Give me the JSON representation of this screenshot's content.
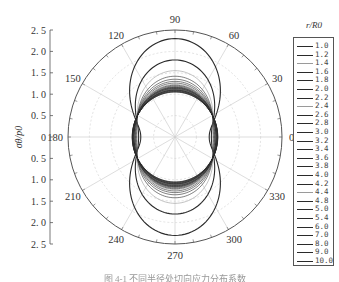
{
  "chart_data": {
    "type": "polar-line",
    "title": "",
    "caption": "图 4-1 不同半径处切向应力分布系数",
    "ylabel": "σθ/p0",
    "radial_axis": {
      "range": [
        0,
        2.5
      ],
      "ticks_upper": [
        "2.5",
        "2.0",
        "1.5",
        "1.0",
        "0.5",
        "0"
      ],
      "ticks_lower": [
        "0.5",
        "1.0",
        "1.5",
        "2.0",
        "2.5"
      ]
    },
    "angular_axis": {
      "unit": "degrees",
      "ticks": [
        0,
        30,
        60,
        90,
        120,
        150,
        180,
        210,
        240,
        270,
        300,
        330
      ],
      "labels": [
        "0",
        "30",
        "60",
        "90",
        "120",
        "150",
        "180",
        "210",
        "240",
        "270",
        "300",
        "330"
      ]
    },
    "legend": {
      "title": "r/R0",
      "position": "right",
      "entries": [
        "1.0",
        "1.2",
        "1.4",
        "1.6",
        "1.8",
        "2.0",
        "2.2",
        "2.4",
        "2.6",
        "2.8",
        "3.0",
        "3.2",
        "3.4",
        "3.6",
        "3.8",
        "4.0",
        "4.2",
        "4.4",
        "4.8",
        "5.0",
        "5.4",
        "6.0",
        "7.0",
        "8.0",
        "9.0",
        "10.0"
      ]
    },
    "series_summary": {
      "description": "Approximate sigma_theta/p0 at 0/180 deg (sides) and 90/270 deg (top/bottom) per r/R0",
      "r_over_R0": [
        1.0,
        1.2,
        1.4,
        1.6,
        1.8,
        2.0,
        2.2,
        2.4,
        2.6,
        2.8,
        3.0,
        3.2,
        3.4,
        3.6,
        3.8,
        4.0,
        4.2,
        4.4,
        4.8,
        5.0,
        5.4,
        6.0,
        7.0,
        8.0,
        9.0,
        10.0
      ],
      "value_at_0deg": [
        0.8,
        0.85,
        0.88,
        0.9,
        0.92,
        0.93,
        0.94,
        0.95,
        0.955,
        0.96,
        0.965,
        0.97,
        0.972,
        0.975,
        0.978,
        0.98,
        0.982,
        0.984,
        0.986,
        0.988,
        0.99,
        0.992,
        0.994,
        0.996,
        0.998,
        1.0
      ],
      "value_at_90deg": [
        2.3,
        1.8,
        1.55,
        1.42,
        1.35,
        1.3,
        1.26,
        1.23,
        1.21,
        1.19,
        1.17,
        1.16,
        1.15,
        1.14,
        1.13,
        1.12,
        1.115,
        1.11,
        1.1,
        1.095,
        1.09,
        1.08,
        1.07,
        1.06,
        1.055,
        1.05
      ]
    },
    "grid": true
  },
  "colors": {
    "outer_circle": "#555555",
    "grid": "#cfcfcf",
    "curve_dark": "#2a2a2a",
    "curve_light": "#9a9a9a"
  }
}
